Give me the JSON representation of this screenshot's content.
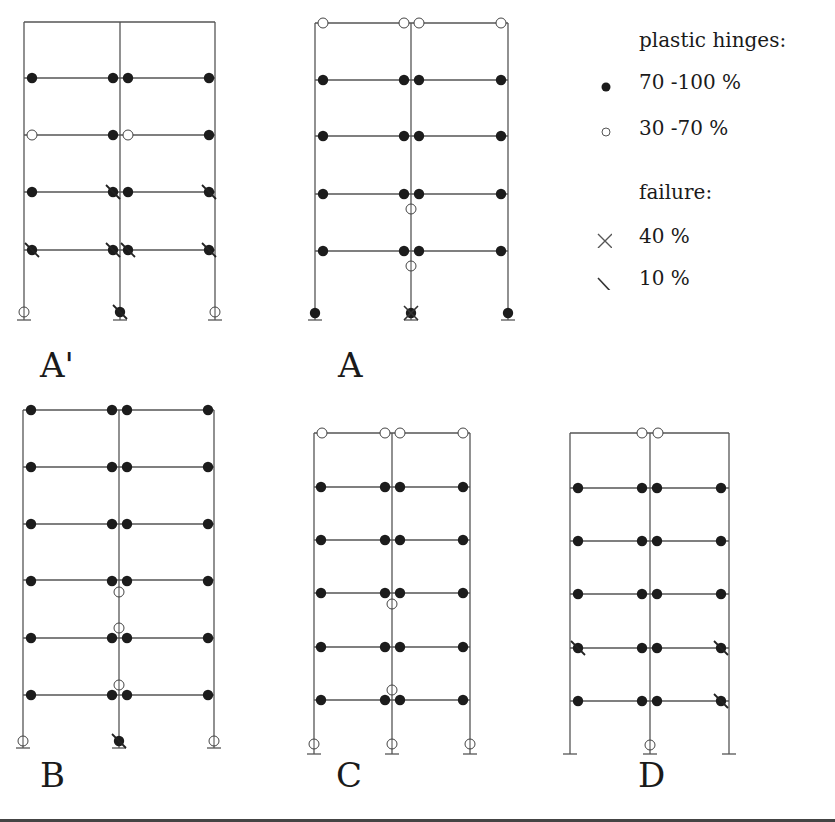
{
  "legend": {
    "hinges_title": "plastic hinges:",
    "hinge_full": "70 -100 %",
    "hinge_partial": "30 -70 %",
    "failure_title": "failure:",
    "failure_x": "40 %",
    "failure_slash": "10 %"
  },
  "colors": {
    "line": "#555555",
    "filled": "#1c1c1c",
    "open_stroke": "#444444"
  },
  "frames": [
    {
      "label": "A'",
      "label_pos": [
        40,
        385
      ],
      "cols": [
        24,
        120,
        215
      ],
      "top": 22,
      "beams": [
        78,
        135,
        192,
        250
      ],
      "base": 320,
      "hinges": [
        {
          "x": 32,
          "y": 78,
          "t": "f"
        },
        {
          "x": 113,
          "y": 78,
          "t": "f"
        },
        {
          "x": 128,
          "y": 78,
          "t": "f"
        },
        {
          "x": 209,
          "y": 78,
          "t": "f"
        },
        {
          "x": 32,
          "y": 135,
          "t": "o"
        },
        {
          "x": 113,
          "y": 135,
          "t": "f"
        },
        {
          "x": 128,
          "y": 135,
          "t": "o"
        },
        {
          "x": 209,
          "y": 135,
          "t": "f"
        },
        {
          "x": 32,
          "y": 192,
          "t": "f"
        },
        {
          "x": 113,
          "y": 192,
          "t": "fs"
        },
        {
          "x": 128,
          "y": 192,
          "t": "f"
        },
        {
          "x": 209,
          "y": 192,
          "t": "fs"
        },
        {
          "x": 32,
          "y": 250,
          "t": "fs"
        },
        {
          "x": 113,
          "y": 250,
          "t": "fs"
        },
        {
          "x": 128,
          "y": 250,
          "t": "fs"
        },
        {
          "x": 209,
          "y": 250,
          "t": "fs"
        },
        {
          "x": 24,
          "y": 312,
          "t": "oc"
        },
        {
          "x": 120,
          "y": 312,
          "t": "fs"
        },
        {
          "x": 215,
          "y": 312,
          "t": "oc"
        }
      ]
    },
    {
      "label": "A",
      "label_pos": [
        338,
        385
      ],
      "cols": [
        315,
        411,
        508
      ],
      "top": 23,
      "beams": [
        80,
        136,
        194,
        251
      ],
      "base": 320,
      "hinges": [
        {
          "x": 323,
          "y": 23,
          "t": "o"
        },
        {
          "x": 404,
          "y": 23,
          "t": "o"
        },
        {
          "x": 419,
          "y": 23,
          "t": "o"
        },
        {
          "x": 501,
          "y": 23,
          "t": "o"
        },
        {
          "x": 323,
          "y": 80,
          "t": "f"
        },
        {
          "x": 404,
          "y": 80,
          "t": "f"
        },
        {
          "x": 419,
          "y": 80,
          "t": "f"
        },
        {
          "x": 501,
          "y": 80,
          "t": "f"
        },
        {
          "x": 323,
          "y": 136,
          "t": "f"
        },
        {
          "x": 404,
          "y": 136,
          "t": "f"
        },
        {
          "x": 419,
          "y": 136,
          "t": "f"
        },
        {
          "x": 501,
          "y": 136,
          "t": "f"
        },
        {
          "x": 323,
          "y": 194,
          "t": "f"
        },
        {
          "x": 404,
          "y": 194,
          "t": "f"
        },
        {
          "x": 419,
          "y": 194,
          "t": "f"
        },
        {
          "x": 501,
          "y": 194,
          "t": "f"
        },
        {
          "x": 411,
          "y": 209,
          "t": "oc"
        },
        {
          "x": 323,
          "y": 251,
          "t": "f"
        },
        {
          "x": 404,
          "y": 251,
          "t": "f"
        },
        {
          "x": 419,
          "y": 251,
          "t": "f"
        },
        {
          "x": 501,
          "y": 251,
          "t": "f"
        },
        {
          "x": 411,
          "y": 266,
          "t": "oc"
        },
        {
          "x": 315,
          "y": 313,
          "t": "f"
        },
        {
          "x": 411,
          "y": 313,
          "t": "fx"
        },
        {
          "x": 508,
          "y": 313,
          "t": "f"
        }
      ]
    },
    {
      "label": "B",
      "label_pos": [
        40,
        795
      ],
      "cols": [
        23,
        119,
        214
      ],
      "top": 410,
      "beams": [
        467,
        524,
        580,
        638,
        695
      ],
      "base": 748,
      "hinges": [
        {
          "x": 31,
          "y": 410,
          "t": "f"
        },
        {
          "x": 112,
          "y": 410,
          "t": "f"
        },
        {
          "x": 127,
          "y": 410,
          "t": "f"
        },
        {
          "x": 208,
          "y": 410,
          "t": "f"
        },
        {
          "x": 31,
          "y": 467,
          "t": "f"
        },
        {
          "x": 112,
          "y": 467,
          "t": "f"
        },
        {
          "x": 127,
          "y": 467,
          "t": "f"
        },
        {
          "x": 208,
          "y": 467,
          "t": "f"
        },
        {
          "x": 31,
          "y": 524,
          "t": "f"
        },
        {
          "x": 112,
          "y": 524,
          "t": "f"
        },
        {
          "x": 127,
          "y": 524,
          "t": "f"
        },
        {
          "x": 208,
          "y": 524,
          "t": "f"
        },
        {
          "x": 31,
          "y": 581,
          "t": "f"
        },
        {
          "x": 112,
          "y": 581,
          "t": "f"
        },
        {
          "x": 127,
          "y": 581,
          "t": "f"
        },
        {
          "x": 208,
          "y": 581,
          "t": "f"
        },
        {
          "x": 119,
          "y": 592,
          "t": "oc"
        },
        {
          "x": 119,
          "y": 628,
          "t": "oc"
        },
        {
          "x": 31,
          "y": 638,
          "t": "f"
        },
        {
          "x": 112,
          "y": 638,
          "t": "f"
        },
        {
          "x": 127,
          "y": 638,
          "t": "f"
        },
        {
          "x": 208,
          "y": 638,
          "t": "f"
        },
        {
          "x": 119,
          "y": 685,
          "t": "oc"
        },
        {
          "x": 31,
          "y": 695,
          "t": "f"
        },
        {
          "x": 112,
          "y": 695,
          "t": "f"
        },
        {
          "x": 127,
          "y": 695,
          "t": "f"
        },
        {
          "x": 208,
          "y": 695,
          "t": "f"
        },
        {
          "x": 23,
          "y": 741,
          "t": "oc"
        },
        {
          "x": 119,
          "y": 741,
          "t": "fs"
        },
        {
          "x": 214,
          "y": 741,
          "t": "oc"
        }
      ]
    },
    {
      "label": "C",
      "label_pos": [
        336,
        795
      ],
      "cols": [
        314,
        392,
        470
      ],
      "top": 433,
      "beams": [
        487,
        540,
        593,
        647,
        700
      ],
      "base": 754,
      "hinges": [
        {
          "x": 322,
          "y": 433,
          "t": "o"
        },
        {
          "x": 385,
          "y": 433,
          "t": "o"
        },
        {
          "x": 400,
          "y": 433,
          "t": "o"
        },
        {
          "x": 463,
          "y": 433,
          "t": "o"
        },
        {
          "x": 321,
          "y": 487,
          "t": "f"
        },
        {
          "x": 385,
          "y": 487,
          "t": "f"
        },
        {
          "x": 400,
          "y": 487,
          "t": "f"
        },
        {
          "x": 463,
          "y": 487,
          "t": "f"
        },
        {
          "x": 321,
          "y": 540,
          "t": "f"
        },
        {
          "x": 385,
          "y": 540,
          "t": "f"
        },
        {
          "x": 400,
          "y": 540,
          "t": "f"
        },
        {
          "x": 463,
          "y": 540,
          "t": "f"
        },
        {
          "x": 321,
          "y": 593,
          "t": "f"
        },
        {
          "x": 385,
          "y": 593,
          "t": "f"
        },
        {
          "x": 400,
          "y": 593,
          "t": "f"
        },
        {
          "x": 463,
          "y": 593,
          "t": "f"
        },
        {
          "x": 392,
          "y": 604,
          "t": "oc"
        },
        {
          "x": 321,
          "y": 647,
          "t": "f"
        },
        {
          "x": 385,
          "y": 647,
          "t": "f"
        },
        {
          "x": 400,
          "y": 647,
          "t": "f"
        },
        {
          "x": 463,
          "y": 647,
          "t": "f"
        },
        {
          "x": 392,
          "y": 690,
          "t": "oc"
        },
        {
          "x": 321,
          "y": 700,
          "t": "f"
        },
        {
          "x": 385,
          "y": 700,
          "t": "f"
        },
        {
          "x": 400,
          "y": 700,
          "t": "f"
        },
        {
          "x": 463,
          "y": 700,
          "t": "f"
        },
        {
          "x": 314,
          "y": 744,
          "t": "oc"
        },
        {
          "x": 392,
          "y": 744,
          "t": "oc"
        },
        {
          "x": 470,
          "y": 744,
          "t": "oc"
        }
      ]
    },
    {
      "label": "D",
      "label_pos": [
        638,
        795
      ],
      "cols": [
        570,
        650,
        729
      ],
      "top": 433,
      "beams": [
        488,
        541,
        594,
        648,
        701
      ],
      "base": 754,
      "hinges": [
        {
          "x": 642,
          "y": 433,
          "t": "o"
        },
        {
          "x": 658,
          "y": 433,
          "t": "o"
        },
        {
          "x": 578,
          "y": 488,
          "t": "f"
        },
        {
          "x": 642,
          "y": 488,
          "t": "f"
        },
        {
          "x": 657,
          "y": 488,
          "t": "f"
        },
        {
          "x": 721,
          "y": 488,
          "t": "f"
        },
        {
          "x": 578,
          "y": 541,
          "t": "f"
        },
        {
          "x": 642,
          "y": 541,
          "t": "f"
        },
        {
          "x": 657,
          "y": 541,
          "t": "f"
        },
        {
          "x": 721,
          "y": 541,
          "t": "f"
        },
        {
          "x": 578,
          "y": 594,
          "t": "f"
        },
        {
          "x": 642,
          "y": 594,
          "t": "f"
        },
        {
          "x": 657,
          "y": 594,
          "t": "f"
        },
        {
          "x": 721,
          "y": 594,
          "t": "f"
        },
        {
          "x": 578,
          "y": 648,
          "t": "fs"
        },
        {
          "x": 642,
          "y": 648,
          "t": "f"
        },
        {
          "x": 657,
          "y": 648,
          "t": "f"
        },
        {
          "x": 721,
          "y": 648,
          "t": "fs"
        },
        {
          "x": 578,
          "y": 701,
          "t": "f"
        },
        {
          "x": 642,
          "y": 701,
          "t": "f"
        },
        {
          "x": 657,
          "y": 701,
          "t": "f"
        },
        {
          "x": 721,
          "y": 701,
          "t": "fs"
        },
        {
          "x": 650,
          "y": 745,
          "t": "oc"
        }
      ]
    }
  ]
}
